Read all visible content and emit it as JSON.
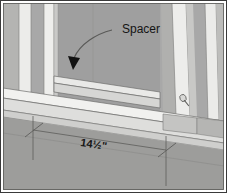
{
  "figure": {
    "kind": "technical-illustration",
    "width": 227,
    "height": 193
  },
  "annotations": {
    "spacer_label": "Spacer",
    "dimension_label": "14½\""
  },
  "colors": {
    "border": "#3a3a3a",
    "page_background": "#ffffff",
    "wall_back": "#a8a8a8",
    "wall_back_shadow": "#9a9a9a",
    "floor": "#9d9d9d",
    "board_light": "#e8e8e6",
    "board_mid": "#d2d2d0",
    "board_edge": "#b9b9b7",
    "stud_face": "#ededeb",
    "stud_side": "#c6c6c4",
    "line": "#6b6b6b",
    "dark_line": "#4a4a4a",
    "text": "#1a1a1a",
    "arrow_fill": "#121212"
  },
  "parts": [
    {
      "name": "back-wall-panel",
      "tone": "wall_back"
    },
    {
      "name": "left-stud",
      "tone": "stud_face"
    },
    {
      "name": "left-inner-stud",
      "tone": "stud_face"
    },
    {
      "name": "right-stud",
      "tone": "stud_face"
    },
    {
      "name": "right-outer-stud",
      "tone": "stud_face"
    },
    {
      "name": "spacer-board",
      "tone": "board_light"
    },
    {
      "name": "bottom-plate",
      "tone": "board_light"
    },
    {
      "name": "floor-surface",
      "tone": "floor"
    },
    {
      "name": "nail-head",
      "tone": "board_edge"
    }
  ],
  "dimension": {
    "label": "14½\"",
    "has_left_tick": true,
    "has_right_tick": true,
    "tick_style": "slash"
  },
  "leader": {
    "style": "curved",
    "arrowhead": "solid-triangle",
    "points_to": "spacer-board"
  }
}
